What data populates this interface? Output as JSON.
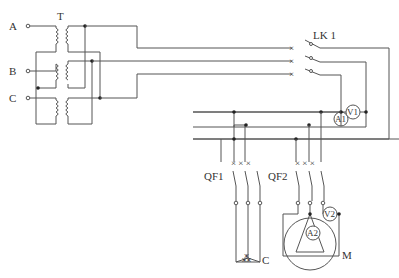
{
  "diagram": {
    "type": "electrical-schematic",
    "inputs": [
      "A",
      "B",
      "C"
    ],
    "transformer_label": "T",
    "switch_label": "LK 1",
    "ammeter_1": "A1",
    "voltmeter_1": "V1",
    "breaker_1": "QF1",
    "breaker_2": "QF2",
    "ammeter_2": "A2",
    "voltmeter_2": "V2",
    "capacitor_label": "C",
    "motor_label": "M"
  }
}
